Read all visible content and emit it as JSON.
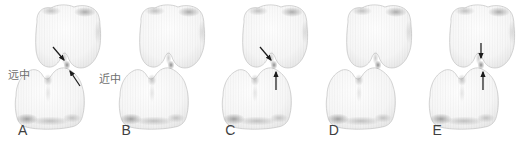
{
  "figure": {
    "background_color": "#ffffff",
    "label_color": "#3f3f3f",
    "annotation_color": "#6e6e6e",
    "arrow_color": "#1c1c1c",
    "tooth_base_color": "#f6f6f6",
    "tooth_edge_color": "#e2e2e2",
    "tooth_shadow_color": "#8e8e8e",
    "panels": [
      {
        "label": "A",
        "arrows": [
          "diagonal-down",
          "diagonal-up"
        ],
        "annotations": {
          "left": "远中",
          "right": "近中"
        }
      },
      {
        "label": "B",
        "arrows": []
      },
      {
        "label": "C",
        "arrows": [
          "diagonal-down",
          "vertical-up"
        ]
      },
      {
        "label": "D",
        "arrows": []
      },
      {
        "label": "E",
        "arrows": [
          "vertical-down",
          "vertical-up"
        ]
      }
    ]
  }
}
